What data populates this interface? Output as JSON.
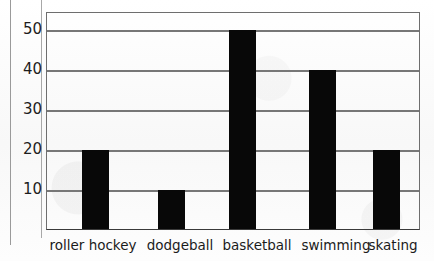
{
  "chart_data": {
    "type": "bar",
    "title": "",
    "xlabel": "",
    "ylabel": "",
    "categories": [
      "roller hockey",
      "dodgeball",
      "basketball",
      "swimming",
      "skating"
    ],
    "values": [
      20,
      10,
      50,
      40,
      20
    ],
    "yticks": [
      10,
      20,
      30,
      40,
      50
    ],
    "ylim": [
      0,
      55
    ],
    "grid": true,
    "legend": false,
    "bar_color": "#080808",
    "gridline_color": "#777777",
    "axis_color": "#3a3a3a",
    "background_color": "#fbfbfb"
  },
  "axis": {
    "ytick_labels": [
      "50",
      "40",
      "30",
      "20",
      "10"
    ]
  }
}
